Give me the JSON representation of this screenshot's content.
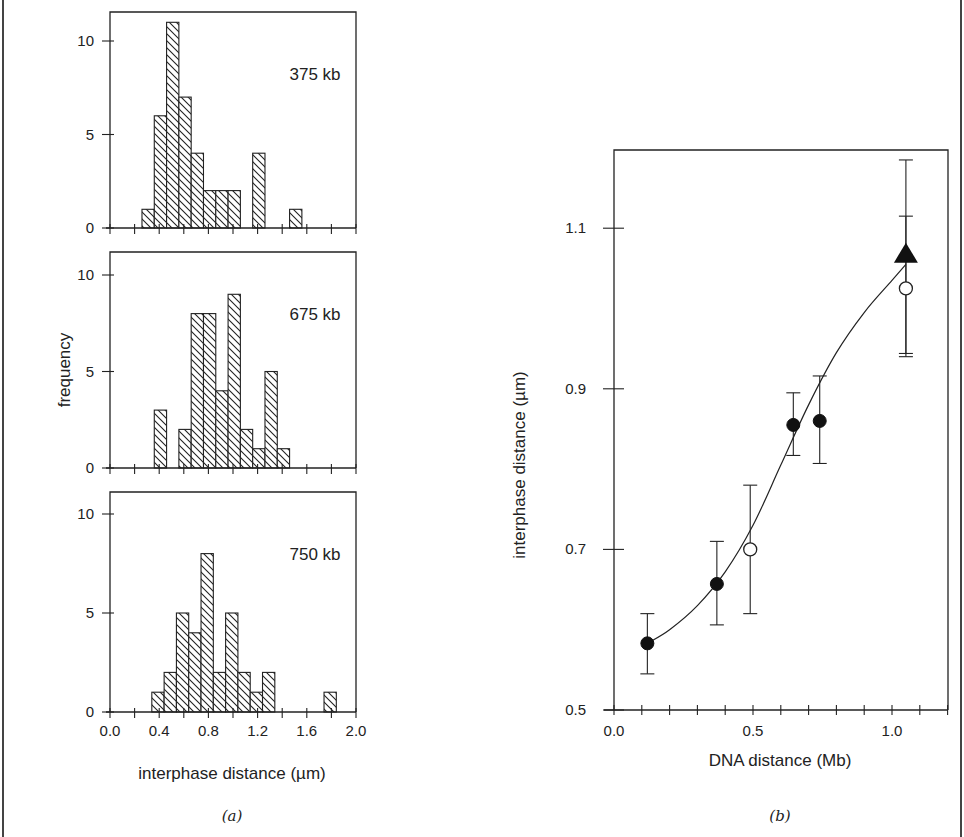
{
  "figure": {
    "panel_a_label": "(a)",
    "panel_b_label": "(b)"
  },
  "chart_data": [
    {
      "type": "bar",
      "panel": "a-top",
      "title": "375 kb",
      "xlabel": "interphase distance (µm)",
      "ylabel": "frequency",
      "xlim": [
        0.0,
        2.0
      ],
      "ylim": [
        0,
        11.5
      ],
      "yticks": [
        0,
        5,
        10
      ],
      "xticks": [
        0.0,
        0.2,
        0.4,
        0.6,
        0.8,
        1.0,
        1.2,
        1.4,
        1.6,
        1.8,
        2.0
      ],
      "bin_width": 0.1,
      "bins": [
        {
          "x": 0.26,
          "count": 1
        },
        {
          "x": 0.36,
          "count": 6
        },
        {
          "x": 0.46,
          "count": 11
        },
        {
          "x": 0.56,
          "count": 7
        },
        {
          "x": 0.66,
          "count": 4
        },
        {
          "x": 0.76,
          "count": 2
        },
        {
          "x": 0.86,
          "count": 2
        },
        {
          "x": 0.96,
          "count": 2
        },
        {
          "x": 1.16,
          "count": 4
        },
        {
          "x": 1.46,
          "count": 1
        }
      ],
      "grid": false
    },
    {
      "type": "bar",
      "panel": "a-middle",
      "title": "675 kb",
      "xlabel": "interphase distance (µm)",
      "ylabel": "frequency",
      "xlim": [
        0.0,
        2.0
      ],
      "ylim": [
        0,
        11.5
      ],
      "yticks": [
        0,
        5,
        10
      ],
      "bin_width": 0.1,
      "bins": [
        {
          "x": 0.36,
          "count": 3
        },
        {
          "x": 0.56,
          "count": 2
        },
        {
          "x": 0.66,
          "count": 8
        },
        {
          "x": 0.76,
          "count": 8
        },
        {
          "x": 0.86,
          "count": 4
        },
        {
          "x": 0.96,
          "count": 9
        },
        {
          "x": 1.06,
          "count": 2
        },
        {
          "x": 1.16,
          "count": 1
        },
        {
          "x": 1.26,
          "count": 5
        },
        {
          "x": 1.36,
          "count": 1
        }
      ],
      "grid": false
    },
    {
      "type": "bar",
      "panel": "a-bottom",
      "title": "750 kb",
      "xlabel": "interphase distance (µm)",
      "ylabel": "frequency",
      "xlim": [
        0.0,
        2.0
      ],
      "ylim": [
        0,
        11.5
      ],
      "yticks": [
        0,
        5,
        10
      ],
      "xtick_labels": [
        "0.0",
        "0.4",
        "0.8",
        "1.2",
        "1.6",
        "2.0"
      ],
      "bin_width": 0.1,
      "bins": [
        {
          "x": 0.34,
          "count": 1
        },
        {
          "x": 0.44,
          "count": 2
        },
        {
          "x": 0.54,
          "count": 5
        },
        {
          "x": 0.64,
          "count": 4
        },
        {
          "x": 0.74,
          "count": 8
        },
        {
          "x": 0.84,
          "count": 2
        },
        {
          "x": 0.94,
          "count": 5
        },
        {
          "x": 1.04,
          "count": 2
        },
        {
          "x": 1.14,
          "count": 1
        },
        {
          "x": 1.24,
          "count": 2
        },
        {
          "x": 1.74,
          "count": 1
        }
      ],
      "grid": false
    },
    {
      "type": "scatter",
      "panel": "b",
      "xlabel": "DNA distance (Mb)",
      "ylabel": "interphase distance (µm)",
      "xlim": [
        0.0,
        1.2
      ],
      "ylim": [
        0.5,
        1.2
      ],
      "xtick_labels": [
        "0.0",
        "0.5",
        "1.0"
      ],
      "xticks_minor_step": 0.1,
      "yticks": [
        0.5,
        0.7,
        0.9,
        1.1
      ],
      "series": [
        {
          "name": "filled circles",
          "marker": "filled-circle",
          "points": [
            {
              "x": 0.12,
              "y": 0.583,
              "err_low": 0.545,
              "err_high": 0.62
            },
            {
              "x": 0.37,
              "y": 0.657,
              "err_low": 0.606,
              "err_high": 0.71
            },
            {
              "x": 0.645,
              "y": 0.855,
              "err_low": 0.817,
              "err_high": 0.895
            },
            {
              "x": 0.74,
              "y": 0.86,
              "err_low": 0.807,
              "err_high": 0.916
            }
          ]
        },
        {
          "name": "open circles",
          "marker": "open-circle",
          "points": [
            {
              "x": 0.49,
              "y": 0.7,
              "err_low": 0.62,
              "err_high": 0.78
            },
            {
              "x": 1.05,
              "y": 1.025,
              "err_low": 0.944,
              "err_high": 1.115
            }
          ]
        },
        {
          "name": "filled triangle",
          "marker": "filled-triangle",
          "points": [
            {
              "x": 1.05,
              "y": 1.067,
              "err_low": 0.94,
              "err_high": 1.185
            }
          ]
        }
      ],
      "fit_curve": [
        [
          0.12,
          0.583
        ],
        [
          0.2,
          0.6
        ],
        [
          0.3,
          0.63
        ],
        [
          0.4,
          0.672
        ],
        [
          0.5,
          0.73
        ],
        [
          0.6,
          0.805
        ],
        [
          0.7,
          0.88
        ],
        [
          0.8,
          0.945
        ],
        [
          0.9,
          0.995
        ],
        [
          1.0,
          1.035
        ],
        [
          1.05,
          1.055
        ]
      ],
      "grid": false
    }
  ]
}
